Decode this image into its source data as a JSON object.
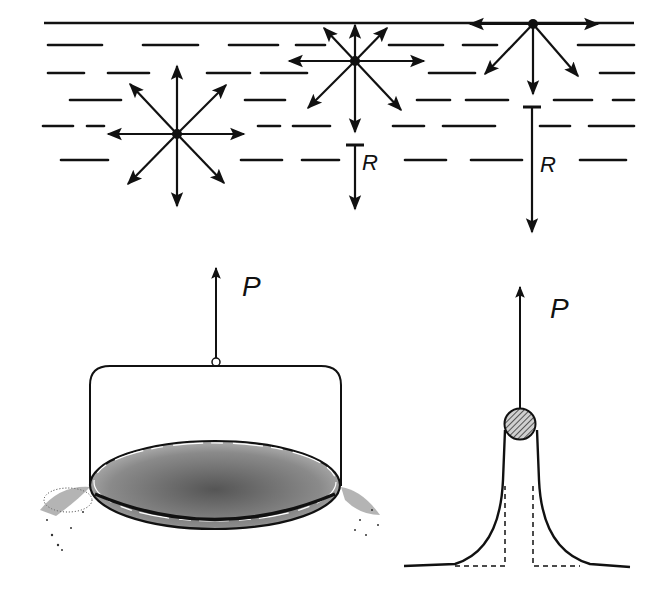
{
  "figure": {
    "colors": {
      "ink": "#111111",
      "background": "#ffffff",
      "hatch": "#555555"
    }
  },
  "top_panel": {
    "name": "liquid-molecular-forces",
    "molecules": [
      {
        "id": "interior",
        "position": "deep in liquid",
        "arrows": 8,
        "resultant_label": ""
      },
      {
        "id": "near-surface",
        "position": "just below surface",
        "arrows": 8,
        "resultant_label": "R"
      },
      {
        "id": "at-surface",
        "position": "on surface",
        "arrows": 5,
        "resultant_label": "R"
      }
    ],
    "labels": {
      "resultant_1": "R",
      "resultant_2": "R"
    }
  },
  "bottom_left_panel": {
    "name": "plate-lifted-from-liquid",
    "force_label": "P"
  },
  "bottom_right_panel": {
    "name": "wire-lifted-from-liquid",
    "force_label": "P"
  }
}
